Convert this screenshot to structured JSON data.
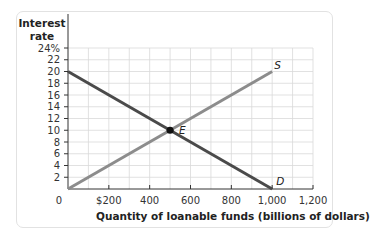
{
  "chart_data": {
    "type": "line",
    "title": "",
    "xlabel": "Quantity of loanable funds (billions of dollars)",
    "ylabel": "Interest rate",
    "xlim": [
      0,
      1200
    ],
    "ylim": [
      0,
      24
    ],
    "x_ticks": [
      0,
      200,
      400,
      600,
      800,
      1000,
      1200
    ],
    "x_tick_labels": [
      "0",
      "$200",
      "400",
      "600",
      "800",
      "1,000",
      "1,200"
    ],
    "y_ticks": [
      2,
      4,
      6,
      8,
      10,
      12,
      14,
      16,
      18,
      20,
      22,
      24
    ],
    "y_tick_labels": [
      "2",
      "4",
      "6",
      "8",
      "10",
      "12",
      "14",
      "16",
      "18",
      "20",
      "22",
      "24%"
    ],
    "grid": true,
    "series": [
      {
        "name": "D",
        "label": "D",
        "color": "#4a4a4a",
        "x": [
          0,
          1000
        ],
        "y": [
          20,
          0
        ]
      },
      {
        "name": "S",
        "label": "S",
        "color": "#8c8c8c",
        "x": [
          0,
          1000
        ],
        "y": [
          0,
          20
        ]
      }
    ],
    "annotations": [
      {
        "label": "E",
        "x": 500,
        "y": 10,
        "type": "point"
      }
    ]
  },
  "labels": {
    "ylabel_line1": "Interest",
    "ylabel_line2": "rate",
    "xlabel": "Quantity of loanable funds (billions of dollars)",
    "origin": "0",
    "demand": "D",
    "supply": "S",
    "equilibrium": "E"
  },
  "colors": {
    "grid": "#d9d9d9",
    "axis": "#333333",
    "demand": "#4a4a4a",
    "supply": "#8c8c8c",
    "point": "#111111",
    "card_border": "#e2e2e2"
  }
}
